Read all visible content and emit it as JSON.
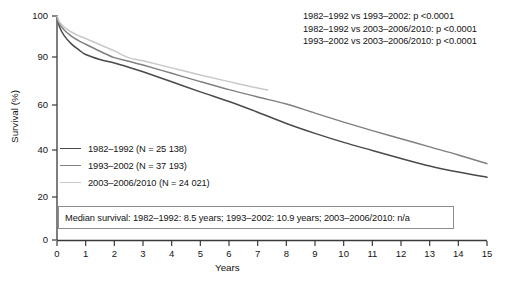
{
  "chart_data": {
    "type": "line",
    "title": "",
    "xlabel": "Years",
    "ylabel": "Survival (%)",
    "xlim": [
      0,
      15
    ],
    "ylim": [
      0,
      100
    ],
    "xticks": [
      0,
      1,
      2,
      3,
      4,
      5,
      6,
      7,
      8,
      9,
      10,
      11,
      12,
      13,
      14,
      15
    ],
    "yticks": [
      0,
      20,
      40,
      60,
      90,
      100
    ],
    "grid": false,
    "legend_position": "center-left",
    "note": "Kaplan-Meier survival curves by diagnosis period; y-axis is broken/compressed between 60 and 100",
    "series": [
      {
        "name": "1982-1992",
        "n": "25 138",
        "color": "#4a4a4a",
        "median_survival": "8.5 years",
        "x": [
          0,
          0.08,
          0.25,
          0.5,
          0.75,
          1,
          1.5,
          2,
          2.5,
          3,
          4,
          5,
          6,
          7,
          8,
          9,
          10,
          11,
          12,
          13,
          14,
          15
        ],
        "y": [
          100,
          97.5,
          95.2,
          93.2,
          91.8,
          90.6,
          88.4,
          86.2,
          83.6,
          80.8,
          74.5,
          68.2,
          62.2,
          56.8,
          51.8,
          47.4,
          43.4,
          39.8,
          36.4,
          33.2,
          30.6,
          28.4
        ]
      },
      {
        "name": "1993-2002",
        "n": "37 193",
        "color": "#808080",
        "median_survival": "10.9 years",
        "x": [
          0,
          0.08,
          0.25,
          0.5,
          0.75,
          1,
          1.5,
          2,
          2.5,
          3,
          4,
          5,
          6,
          7,
          8,
          9,
          10,
          11,
          12,
          13,
          14,
          15
        ],
        "y": [
          100,
          98.2,
          96.6,
          95.1,
          94.0,
          93.1,
          91.4,
          89.6,
          87.4,
          85.0,
          79.8,
          74.6,
          69.6,
          65.0,
          60.6,
          56.4,
          52.4,
          48.6,
          45.0,
          41.4,
          37.9,
          34.2
        ]
      },
      {
        "name": "2003-2006/2010",
        "n": "24 021",
        "color": "#c8c8c8",
        "median_survival": "n/a",
        "x": [
          0,
          0.08,
          0.25,
          0.5,
          0.75,
          1,
          1.5,
          2,
          2.5,
          3,
          4,
          5,
          6,
          7,
          7.35
        ],
        "y": [
          100,
          98.6,
          97.3,
          96.1,
          95.2,
          94.5,
          93.0,
          91.5,
          89.6,
          87.6,
          83.2,
          78.8,
          74.6,
          70.6,
          69.4
        ]
      }
    ],
    "p_values": [
      "1982–1992 vs 1993–2002: p <0.0001",
      "1982–1992 vs 2003–2006/2010: p <0.0001",
      "1993–2002 vs 2003–2006/2010: p <0.0001"
    ],
    "legend_entries": [
      "1982–1992 (N = 25 138)",
      "1993–2002 (N = 37 193)",
      "2003–2006/2010 (N = 24 021)"
    ],
    "median_survival_text": "Median survival: 1982–1992: 8.5 years; 1993–2002: 10.9 years; 2003–2006/2010: n/a"
  }
}
